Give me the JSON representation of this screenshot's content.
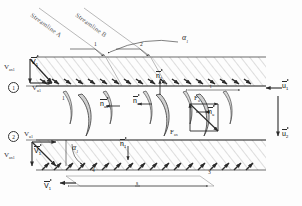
{
  "diagram": {
    "type": "engineering-schematic",
    "colors": {
      "line": "#2b2b2b",
      "hatch": "#9a9a9a",
      "blade_fill": "#d8d8d8",
      "blade_stroke": "#4a4a4a",
      "label": "#2b2b2b",
      "faint": "#777777",
      "background": "#ffffff"
    }
  },
  "streamlines": {
    "a": "Streamline A",
    "b": "Streamline B"
  },
  "stations": {
    "one": "1",
    "two": "2",
    "three": "3",
    "four": "4",
    "blade_one": "1",
    "blade_two": "2"
  },
  "angles": {
    "alpha_top": "α",
    "alpha_top_sub": "1",
    "alpha_bottom": "α",
    "alpha_bottom_sub": "1"
  },
  "velocities": {
    "v_ax1_top": "V",
    "v_ax1_top_sub": "ax1",
    "v_u1_top": "V",
    "v_u1_top_sub": "u1",
    "v1_top": "V",
    "v1_top_sub": "1",
    "v_ax1_bot": "V",
    "v_ax1_bot_sub": "ax1",
    "v_u1_bot": "V",
    "v_u1_bot_sub": "u1",
    "v1_bot": "V",
    "v1_bot_sub": "1",
    "v1_arrow": "V",
    "v1_arrow_sub": "1"
  },
  "normals": {
    "n1_top": "n",
    "n1_top_sub": "1",
    "n_ax_left": "n",
    "n_ax_left_sub": "ax",
    "n_u_mid": "n",
    "n_u_mid_sub": "u",
    "n_right": "n",
    "n_right_sub": "u",
    "n1_bottom": "n",
    "n1_bottom_sub": "1"
  },
  "forces": {
    "f_u": "F",
    "f_u_sub": "u",
    "f_ax": "F",
    "f_ax_sub": "ax"
  },
  "blade_speed": {
    "u_top": "u",
    "u_top_sub": "1",
    "u_bottom": "u",
    "u_bottom_sub": "2"
  },
  "dimensions": {
    "pitch": "s",
    "chord": "t"
  }
}
